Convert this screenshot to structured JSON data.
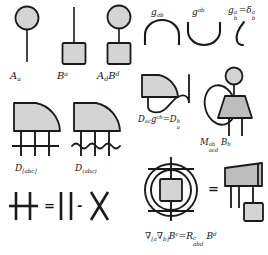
{
  "diagram": {
    "palette": {
      "shape_fill": "#d4d4d4",
      "shape_fill_dark": "#bdbdbd",
      "stroke": "#1a1a1a",
      "background": "#ffffff"
    },
    "row1": {
      "items": [
        {
          "label_id": "A_a",
          "text": "Aa",
          "glyph": "circle-on-stem"
        },
        {
          "label_id": "B_up_a",
          "text": "Ba",
          "glyph": "square-on-stem"
        },
        {
          "label_id": "A_d_B_d",
          "text": "AdBd",
          "glyph": "circle-over-square"
        }
      ],
      "labels": [
        {
          "base": "A",
          "sub": "a",
          "sup": ""
        },
        {
          "base": "B",
          "sub": "",
          "sup": "a"
        },
        {
          "base": "A",
          "sub": "d",
          "sup": "",
          "base2": "B",
          "sup2": "d"
        }
      ]
    },
    "metric_row": {
      "items": [
        {
          "label_id": "g_ab",
          "base": "g",
          "sub": "ab",
          "sup": "",
          "glyph": "cap-arc"
        },
        {
          "label_id": "g_sup_ab",
          "base": "g",
          "sub": "",
          "sup": "ab",
          "glyph": "cup-arc"
        },
        {
          "label_id": "kronecker",
          "glyph": "hook-line"
        }
      ],
      "kronecker_equation": {
        "lhs_base": "g",
        "lhs_sup": "a",
        "lhs_sub": "b",
        "eq": "=",
        "rhs_base": "δ",
        "rhs_sup": "a",
        "rhs_sub": "b"
      }
    },
    "sym_row": {
      "antisymmetric": {
        "label_base": "D",
        "label_sub": "[abc]",
        "glyph": "quarter-disc-3legs-bar",
        "bar_style": "straight"
      },
      "symmetric": {
        "label_base": "D",
        "label_sub": "(abc)",
        "glyph": "quarter-disc-3legs-wave",
        "bar_style": "wavy"
      }
    },
    "contraction": {
      "label_parts": {
        "d": "D",
        "sub1": "ac",
        "g": "g",
        "sup1": "cb",
        "eq": "=",
        "d2": "D",
        "sup2": "b",
        "sub2": "a"
      },
      "label_text": "Dac g^cb = D^b_a",
      "glyph": "quarter-disc-with-hook"
    },
    "multi_index": {
      "label_text": "M^{ab}_{acd} B_b",
      "parts": {
        "m": "M",
        "m_sup": "ab",
        "m_sub": "acd",
        "b": "B",
        "b_sub": "b"
      },
      "glyph": "trapezoid-loop-circle-legs"
    },
    "curvature": {
      "equation_text": "∇[a ∇b] B^c = R^c_abd B^d",
      "parts": {
        "nabla1": "∇",
        "nabla1_sub": "[a",
        "nabla2": "∇",
        "nabla2_sub": "b]",
        "bvec": "B",
        "bvec_sup": "c",
        "eq": "=",
        "riemann": "R",
        "riemann_sup": "c",
        "riemann_sub": "abd",
        "bvec2": "B",
        "bvec2_sup": "d"
      },
      "lhs_glyph": "double-circle-square-crossbars",
      "equals": "=",
      "rhs_glyph": "trapezoid-over-square"
    },
    "identity": {
      "lhs_glyph": "two-lines-with-crossbar",
      "equals": "=",
      "term1_glyph": "two-parallel-lines",
      "minus": "-",
      "term2_glyph": "crossed-lines",
      "equals_text": "=",
      "minus_text": "-"
    }
  }
}
